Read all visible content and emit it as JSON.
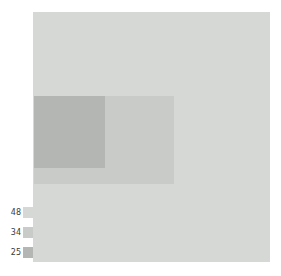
{
  "figure": {
    "background_color": "#ffffff",
    "width": 281,
    "height": 276
  },
  "plot": {
    "name": "overlapping-rectangles-panel",
    "background_color": "#d6d8d6"
  },
  "legend": {
    "position": "lower-left-outside",
    "entries": [
      {
        "label": "48",
        "color": "#d6d8d6",
        "swatch_name": "legend-swatch-48"
      },
      {
        "label": "34",
        "color": "#c9cbc9",
        "swatch_name": "legend-swatch-34"
      },
      {
        "label": "25",
        "color": "#b4b6b4",
        "swatch_name": "legend-swatch-25"
      }
    ]
  },
  "chart_data": {
    "type": "heatmap",
    "title": "",
    "subtitle": "",
    "xlabel": "",
    "ylabel": "",
    "grid": false,
    "legend_position": "lower-left-outside",
    "legend_entries": [
      "48",
      "34",
      "25"
    ],
    "colors": [
      "#d6d8d6",
      "#c9cbc9",
      "#b4b6b4"
    ],
    "values": [
      48,
      34,
      25
    ],
    "regions": [
      {
        "name": "background-region",
        "value": 48,
        "color": "#d6d8d6",
        "x": 0.0,
        "y": 0.0,
        "width": 1.0,
        "height": 1.0
      },
      {
        "name": "middle-region",
        "value": 34,
        "color": "#c9cbc9",
        "x": 0.0,
        "y": 0.336,
        "width": 0.591,
        "height": 0.352
      },
      {
        "name": "overlap-region",
        "value": 25,
        "color": "#b4b6b4",
        "x": 0.0,
        "y": 0.336,
        "width": 0.3,
        "height": 0.288
      }
    ]
  }
}
